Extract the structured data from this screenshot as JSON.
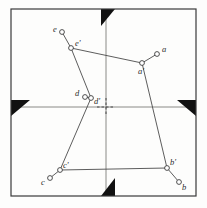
{
  "figure": {
    "frame": {
      "x": 11,
      "y": 9,
      "width": 185,
      "height": 187,
      "stroke": "#3a3a3a",
      "stroke_width": 1.2
    },
    "grid": {
      "horizontal_y": 107,
      "vertical_x": 106,
      "stroke": "#8a8a86",
      "stroke_width": 1.0
    },
    "center_cross": {
      "x": 106,
      "y": 107,
      "arm": 9,
      "stroke": "#4a4a4a",
      "dash": "2.5,2"
    },
    "fiducials": [
      {
        "name": "top-center-fiducial",
        "points": "101,9 115,9 101,26"
      },
      {
        "name": "left-center-fiducial",
        "points": "11,100 11,116 30,100"
      },
      {
        "name": "right-center-fiducial",
        "points": "196,100 196,116 177,100"
      },
      {
        "name": "bottom-center-fiducial",
        "points": "101,196 115,196 115,178"
      }
    ],
    "fiducial_color": "#111111",
    "line_color": "#4b4b4b",
    "marker": {
      "radius": 2.4,
      "stroke": "#3c3c3c",
      "fill": "#ffffff",
      "stroke_width": 0.9
    },
    "polygon": {
      "name": "measured-pentagon",
      "closed": false,
      "path": "e'-a'-b'-c'-d'-e'",
      "points": "71,48 142,63 167,168 60,170 91,98 71,48"
    },
    "points": [
      {
        "id": "a",
        "label": "a",
        "x": 157,
        "y": 54,
        "label_dx": 5,
        "label_dy": -9
      },
      {
        "id": "ap",
        "label": "a'",
        "x": 142,
        "y": 63,
        "label_dx": -4,
        "label_dy": 4
      },
      {
        "id": "b",
        "label": "b",
        "x": 179,
        "y": 182,
        "label_dx": 3,
        "label_dy": 1
      },
      {
        "id": "bp",
        "label": "b'",
        "x": 167,
        "y": 168,
        "label_dx": 3,
        "label_dy": -10
      },
      {
        "id": "c",
        "label": "c",
        "x": 50,
        "y": 178,
        "label_dx": -9,
        "label_dy": 0
      },
      {
        "id": "cp",
        "label": "c'",
        "x": 60,
        "y": 170,
        "label_dx": 3,
        "label_dy": -9
      },
      {
        "id": "d",
        "label": "d",
        "x": 85,
        "y": 97,
        "label_dx": -10,
        "label_dy": -8
      },
      {
        "id": "dp",
        "label": "d'",
        "x": 91,
        "y": 98,
        "label_dx": 3,
        "label_dy": -1
      },
      {
        "id": "e",
        "label": "e",
        "x": 62,
        "y": 32,
        "label_dx": -9,
        "label_dy": -7
      },
      {
        "id": "ep",
        "label": "e'",
        "x": 71,
        "y": 48,
        "label_dx": 4,
        "label_dy": -9
      }
    ],
    "stubs": [
      {
        "name": "stub-a",
        "x1": 142,
        "y1": 63,
        "x2": 157,
        "y2": 54
      },
      {
        "name": "stub-b",
        "x1": 167,
        "y1": 168,
        "x2": 179,
        "y2": 182
      },
      {
        "name": "stub-c",
        "x1": 60,
        "y1": 170,
        "x2": 50,
        "y2": 178
      },
      {
        "name": "stub-d",
        "x1": 91,
        "y1": 98,
        "x2": 85,
        "y2": 97
      },
      {
        "name": "stub-e",
        "x1": 71,
        "y1": 48,
        "x2": 62,
        "y2": 32
      }
    ]
  }
}
